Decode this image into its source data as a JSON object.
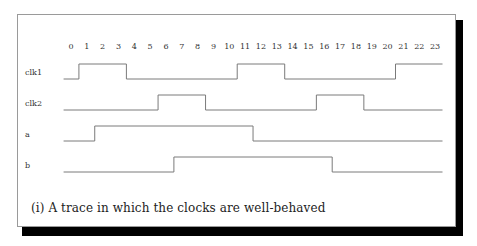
{
  "figure": {
    "caption": "(i) A trace in which the clocks are well-behaved"
  },
  "chart_data": {
    "type": "timing-diagram",
    "title": "",
    "xlabel": "",
    "ticks": [
      0,
      1,
      2,
      3,
      4,
      5,
      6,
      7,
      8,
      9,
      10,
      11,
      12,
      13,
      14,
      15,
      16,
      17,
      18,
      19,
      20,
      21,
      22,
      23
    ],
    "signals": [
      {
        "name": "clk1",
        "initial": 0,
        "transitions": [
          {
            "at": 0.5,
            "to": 1
          },
          {
            "at": 3.5,
            "to": 0
          },
          {
            "at": 10.5,
            "to": 1
          },
          {
            "at": 13.5,
            "to": 0
          },
          {
            "at": 20.5,
            "to": 1
          }
        ]
      },
      {
        "name": "clk2",
        "initial": 0,
        "transitions": [
          {
            "at": 5.5,
            "to": 1
          },
          {
            "at": 8.5,
            "to": 0
          },
          {
            "at": 15.5,
            "to": 1
          },
          {
            "at": 18.5,
            "to": 0
          }
        ]
      },
      {
        "name": "a",
        "initial": 0,
        "transitions": [
          {
            "at": 1.5,
            "to": 1
          },
          {
            "at": 11.5,
            "to": 0
          }
        ]
      },
      {
        "name": "b",
        "initial": 0,
        "transitions": [
          {
            "at": 6.5,
            "to": 1
          },
          {
            "at": 16.5,
            "to": 0
          }
        ]
      }
    ],
    "range": [
      -0.5,
      23.5
    ]
  },
  "colors": {
    "trace": "#7a7a7a",
    "text": "#333333",
    "shadow": "#000000"
  }
}
